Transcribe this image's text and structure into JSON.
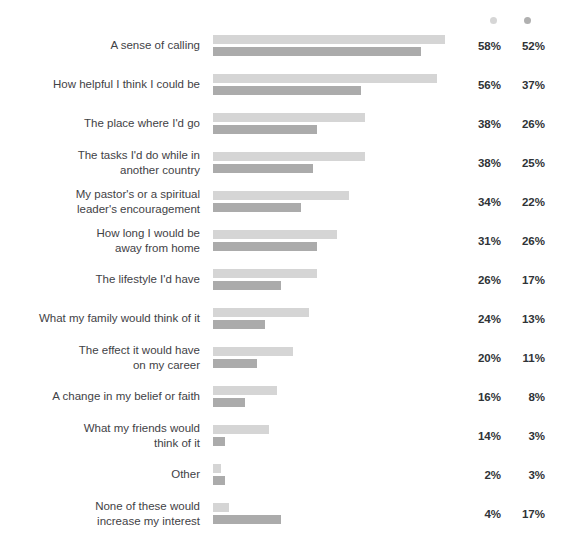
{
  "chart_data": {
    "type": "bar",
    "orientation": "horizontal",
    "title": "",
    "xlabel": "",
    "ylabel": "",
    "grid": false,
    "legend_position": "top-right",
    "xlim": [
      0,
      60
    ],
    "value_suffix": "%",
    "categories": [
      "A sense of calling",
      "How helpful I think I could be",
      "The place where I'd go",
      "The tasks I'd do while in\nanother country",
      "My pastor's or a spiritual\nleader's encouragement",
      "How long I would be\naway from home",
      "The lifestyle I'd have",
      "What my family would think of it",
      "The effect it would have\non my career",
      "A change in my belief or faith",
      "What my friends would\nthink of it",
      "Other",
      "None of these would\nincrease my interest"
    ],
    "series": [
      {
        "name": "series-a",
        "color": "#d5d5d5",
        "values": [
          58,
          56,
          38,
          38,
          34,
          31,
          26,
          24,
          20,
          16,
          14,
          2,
          4
        ],
        "labels": [
          "58%",
          "56%",
          "38%",
          "38%",
          "34%",
          "31%",
          "26%",
          "24%",
          "20%",
          "16%",
          "14%",
          "2%",
          "4%"
        ]
      },
      {
        "name": "series-b",
        "color": "#ababab",
        "values": [
          52,
          37,
          26,
          25,
          22,
          26,
          17,
          13,
          11,
          8,
          3,
          3,
          17
        ],
        "labels": [
          "52%",
          "37%",
          "26%",
          "25%",
          "22%",
          "26%",
          "17%",
          "13%",
          "11%",
          "8%",
          "3%",
          "3%",
          "17%"
        ]
      }
    ]
  },
  "legend": {
    "series_a_marker": "dot",
    "series_b_marker": "dot"
  }
}
